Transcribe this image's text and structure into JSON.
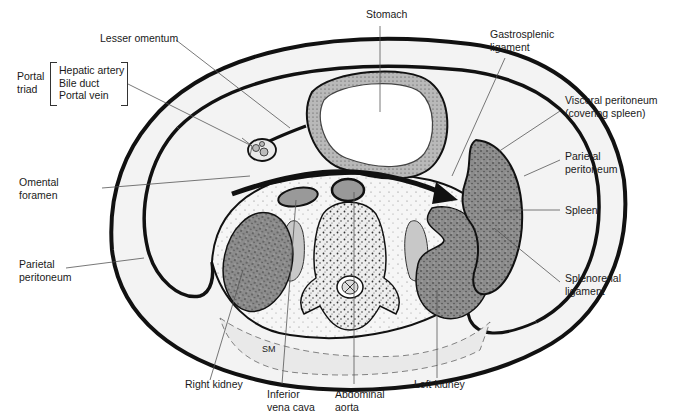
{
  "figure": {
    "artist_initials": "SM"
  },
  "labels": {
    "stomach": "Stomach",
    "lesser_omentum": "Lesser omentum",
    "gastrosplenic_1": "Gastrosplenic",
    "gastrosplenic_2": "ligament",
    "portal_triad_1": "Portal",
    "portal_triad_2": "triad",
    "portal_items": [
      "Hepatic artery",
      "Bile duct",
      "Portal vein"
    ],
    "visceral_1": "Visceral peritoneum",
    "visceral_2": "(covering spleen)",
    "parietal_right_1": "Parietal",
    "parietal_right_2": "peritoneum",
    "omental_1": "Omental",
    "omental_2": "foramen",
    "spleen": "Spleen",
    "parietal_left_1": "Parietal",
    "parietal_left_2": "peritoneum",
    "splenorenal_1": "Splenorenal",
    "splenorenal_2": "ligament",
    "right_kidney": "Right kidney",
    "ivc_1": "Inferior",
    "ivc_2": "vena cava",
    "aorta_1": "Abdominal",
    "aorta_2": "aorta",
    "left_kidney": "Left kidney"
  },
  "colors": {
    "outline": "#111111",
    "organ_fill": "#8a8a8a",
    "vessel_fill": "#9a9a9a",
    "wall_fill": "#f2f2f2",
    "leader": "#555555"
  }
}
